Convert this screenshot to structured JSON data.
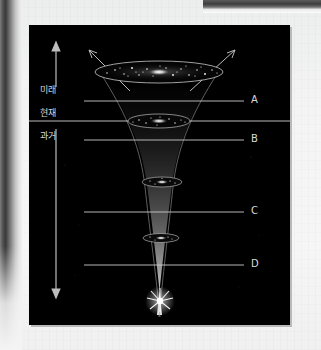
{
  "page": {
    "background_color": "#f2f2f2",
    "plate_background_color": "#000000",
    "accent_color": "#d8d8d8"
  },
  "figure": {
    "time_axis": {
      "future_label": "미래",
      "present_label": "현재",
      "past_label": "과거",
      "up_arrow_icon": "arrow-up-icon",
      "down_arrow_icon": "arrow-down-icon"
    },
    "callouts": [
      {
        "id": "A",
        "label": "A",
        "y": 101
      },
      {
        "id": "B",
        "label": "B",
        "y": 140
      },
      {
        "id": "C",
        "label": "C",
        "y": 212
      },
      {
        "id": "D",
        "label": "D",
        "y": 265
      }
    ],
    "present_divider": {
      "label": "",
      "y": 121
    },
    "expansion_arrows": [
      {
        "id": "left-expansion-arrow",
        "direction": "up-left"
      },
      {
        "id": "right-expansion-arrow",
        "direction": "up-right"
      }
    ],
    "galaxies": [
      {
        "id": "galaxy-future",
        "y": 72,
        "width": 122,
        "height": 20
      },
      {
        "id": "galaxy-present",
        "y": 121,
        "width": 60,
        "height": 13
      },
      {
        "id": "galaxy-past-upper",
        "y": 182,
        "width": 38,
        "height": 9
      },
      {
        "id": "galaxy-past-lower",
        "y": 238,
        "width": 34,
        "height": 8
      }
    ],
    "big_bang": {
      "id": "big-bang-burst",
      "x": 162,
      "y": 301,
      "icon": "starburst-icon"
    }
  }
}
